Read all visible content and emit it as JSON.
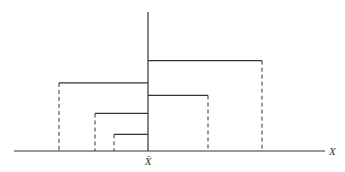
{
  "diagram": {
    "type": "bracket-diagram",
    "labels": {
      "mean": "X̄",
      "axis": "X"
    },
    "colors": {
      "line": "#333333",
      "background": "#ffffff"
    },
    "left_brackets": [
      {
        "id": "left-outer",
        "relative_extent": 0.89,
        "relative_height": 0.49
      },
      {
        "id": "left-middle",
        "relative_extent": 0.53,
        "relative_height": 0.27
      },
      {
        "id": "left-inner",
        "relative_extent": 0.34,
        "relative_height": 0.12
      }
    ],
    "right_brackets": [
      {
        "id": "right-outer",
        "relative_extent": 1.14,
        "relative_height": 0.65
      },
      {
        "id": "right-inner",
        "relative_extent": 0.6,
        "relative_height": 0.4
      }
    ]
  }
}
